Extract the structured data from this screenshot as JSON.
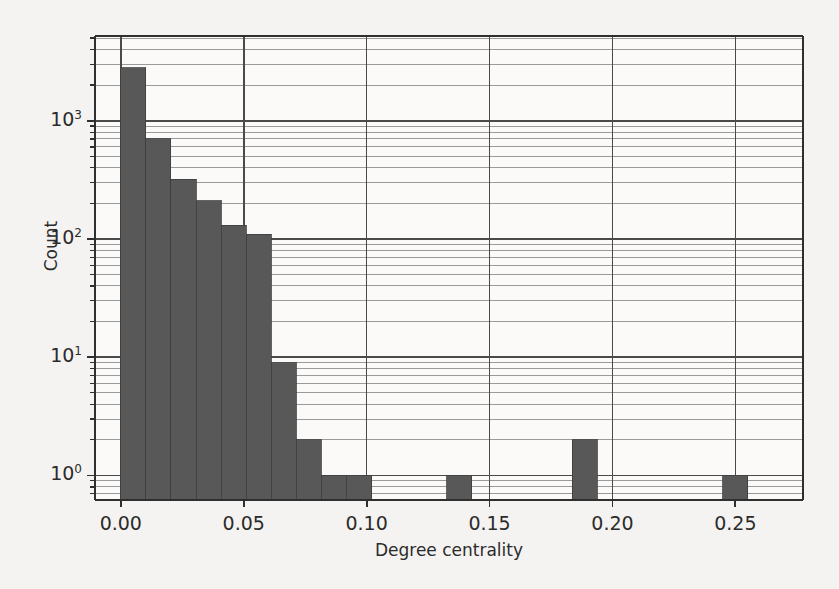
{
  "figure": {
    "background_color": "#f4f3f1",
    "bar_color": "#585858",
    "axis_color": "#2f2f2f",
    "grid_major_color": "#4a4a4a",
    "grid_minor_color": "#9a9a9a"
  },
  "axes": {
    "x_label": "Degree centrality",
    "y_label": "Count",
    "x_ticks": [
      {
        "value": 0.0,
        "label": "0.00"
      },
      {
        "value": 0.05,
        "label": "0.05"
      },
      {
        "value": 0.1,
        "label": "0.10"
      },
      {
        "value": 0.15,
        "label": "0.15"
      },
      {
        "value": 0.2,
        "label": "0.20"
      },
      {
        "value": 0.25,
        "label": "0.25"
      }
    ],
    "y_ticks": [
      {
        "value": 1,
        "label": "10",
        "exponent": "0"
      },
      {
        "value": 10,
        "label": "10",
        "exponent": "1"
      },
      {
        "value": 100,
        "label": "10",
        "exponent": "2"
      },
      {
        "value": 1000,
        "label": "10",
        "exponent": "3"
      }
    ]
  },
  "chart_data": {
    "type": "bar",
    "title": "",
    "subtitle": "",
    "xlabel": "Degree centrality",
    "ylabel": "Count",
    "yscale": "log",
    "xlim": [
      -0.0105,
      0.2775
    ],
    "ylim": [
      0.62,
      5200
    ],
    "grid": true,
    "grid_axis": "y",
    "legend": "none",
    "bin_width": 0.0102,
    "bar_color": "#585858",
    "categories": [
      "0.000-0.010",
      "0.010-0.020",
      "0.020-0.031",
      "0.031-0.041",
      "0.041-0.051",
      "0.051-0.061",
      "0.061-0.071",
      "0.071-0.082",
      "0.082-0.092",
      "0.092-0.102",
      "0.133-0.143",
      "0.184-0.194",
      "0.245-0.255"
    ],
    "x": [
      0.0051,
      0.0153,
      0.0255,
      0.0357,
      0.0459,
      0.0561,
      0.0663,
      0.0765,
      0.0867,
      0.0969,
      0.1377,
      0.1887,
      0.2499
    ],
    "values": [
      2800,
      700,
      320,
      210,
      130,
      110,
      9,
      2,
      1,
      1,
      1,
      2,
      1
    ],
    "bars": [
      {
        "x0": 0.0,
        "x1": 0.0102,
        "count": 2800
      },
      {
        "x0": 0.0102,
        "x1": 0.0204,
        "count": 700
      },
      {
        "x0": 0.0204,
        "x1": 0.0306,
        "count": 320
      },
      {
        "x0": 0.0306,
        "x1": 0.0408,
        "count": 210
      },
      {
        "x0": 0.0408,
        "x1": 0.051,
        "count": 130
      },
      {
        "x0": 0.051,
        "x1": 0.0612,
        "count": 110
      },
      {
        "x0": 0.0612,
        "x1": 0.0714,
        "count": 9
      },
      {
        "x0": 0.0714,
        "x1": 0.0816,
        "count": 2
      },
      {
        "x0": 0.0816,
        "x1": 0.0918,
        "count": 1
      },
      {
        "x0": 0.0918,
        "x1": 0.102,
        "count": 1
      },
      {
        "x0": 0.1326,
        "x1": 0.1428,
        "count": 1
      },
      {
        "x0": 0.1836,
        "x1": 0.1938,
        "count": 2
      },
      {
        "x0": 0.2448,
        "x1": 0.255,
        "count": 1
      }
    ]
  }
}
